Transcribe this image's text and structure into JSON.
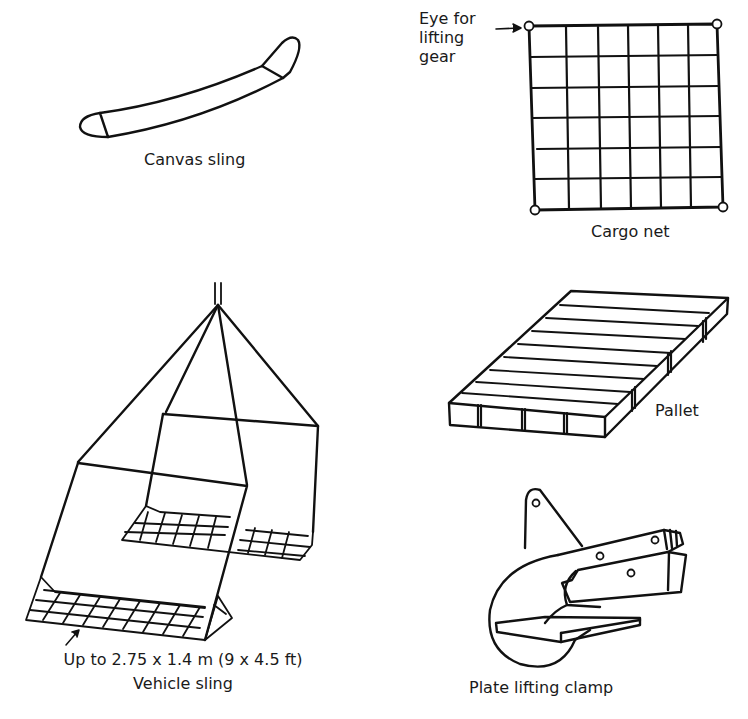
{
  "figure": {
    "items": [
      {
        "id": "canvas-sling",
        "label": "Canvas sling"
      },
      {
        "id": "cargo-net",
        "label": "Cargo net",
        "annotation": "Eye for lifting gear",
        "annotation_lines": [
          "Eye for",
          "lifting",
          "gear"
        ]
      },
      {
        "id": "vehicle-sling",
        "label": "Vehicle sling",
        "dimension_note": "Up to 2.75 x 1.4 m (9 x 4.5 ft)"
      },
      {
        "id": "pallet",
        "label": "Pallet"
      },
      {
        "id": "plate-lifting-clamp",
        "label": "Plate lifting clamp"
      }
    ]
  },
  "colors": {
    "stroke": "#111111",
    "background": "#ffffff",
    "text": "#1a1a1a"
  }
}
